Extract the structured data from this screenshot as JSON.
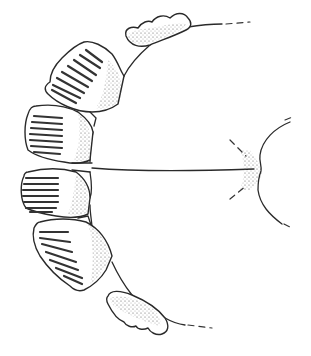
{
  "figure": {
    "type": "line-drawing",
    "colors": {
      "ink": "#2a2a2a",
      "background": "#ffffff",
      "stipple": "#555555"
    },
    "parts": [
      {
        "name": "upper-lobe",
        "kind": "wavy lobe with stippling"
      },
      {
        "name": "plate-1",
        "kind": "ribbed plate",
        "ribs": 8
      },
      {
        "name": "plate-2",
        "kind": "ribbed plate",
        "ribs": 7
      },
      {
        "name": "plate-3",
        "kind": "ribbed plate",
        "ribs": 7
      },
      {
        "name": "plate-4",
        "kind": "ribbed plate",
        "ribs": 7
      },
      {
        "name": "lower-lobe",
        "kind": "wavy lobe with stippling"
      },
      {
        "name": "body-outline",
        "kind": "curved outline with median line"
      },
      {
        "name": "notch",
        "kind": "stippled indentation at right"
      }
    ]
  }
}
